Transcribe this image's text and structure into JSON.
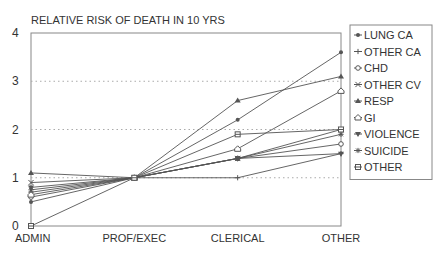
{
  "chart_data": {
    "type": "line",
    "title": "RELATIVE RISK OF DEATH IN 10 YRS",
    "xlabel": "",
    "ylabel": "",
    "categories": [
      "ADMIN",
      "PROF/EXEC",
      "CLERICAL",
      "OTHER"
    ],
    "ylim": [
      0,
      4
    ],
    "yticks": [
      0,
      1,
      2,
      3,
      4
    ],
    "grid": "dotted horizontal at 1, 2, 3",
    "legend_position": "right",
    "series": [
      {
        "name": "LUNG CA",
        "marker": "dot",
        "values": [
          0.5,
          1.0,
          2.2,
          3.6
        ]
      },
      {
        "name": "OTHER CA",
        "marker": "plus",
        "values": [
          0.7,
          1.0,
          1.0,
          1.5
        ]
      },
      {
        "name": "CHD",
        "marker": "circle",
        "values": [
          0.6,
          1.0,
          1.4,
          1.7
        ]
      },
      {
        "name": "OTHER CV",
        "marker": "x",
        "values": [
          0.9,
          1.0,
          1.4,
          2.0
        ]
      },
      {
        "name": "RESP",
        "marker": "triangle-up",
        "values": [
          1.1,
          1.0,
          2.6,
          3.1
        ]
      },
      {
        "name": "GI",
        "marker": "house",
        "values": [
          0.65,
          1.0,
          1.6,
          2.8
        ]
      },
      {
        "name": "VIOLENCE",
        "marker": "triangle-down",
        "values": [
          0.8,
          1.0,
          1.4,
          1.5
        ]
      },
      {
        "name": "SUICIDE",
        "marker": "star",
        "values": [
          0.75,
          1.0,
          1.4,
          1.9
        ]
      },
      {
        "name": "OTHER",
        "marker": "square-line",
        "values": [
          0.0,
          1.0,
          1.9,
          2.0
        ]
      }
    ]
  },
  "colors": {
    "line": "#555555",
    "grid": "#aaaaaa",
    "text": "#333333"
  }
}
